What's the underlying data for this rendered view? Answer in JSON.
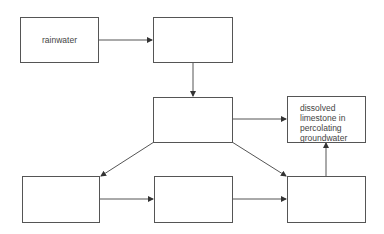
{
  "diagram": {
    "title": "",
    "nodes": [
      {
        "id": "rainwater",
        "label": "rainwater"
      },
      {
        "id": "box2",
        "label": ""
      },
      {
        "id": "box3",
        "label": ""
      },
      {
        "id": "dissolved",
        "label": "dissolved limestone in percolating groundwater",
        "lines": [
          "dissolved",
          "limestone in",
          "percolating",
          "groundwater"
        ]
      },
      {
        "id": "bottom_left",
        "label": ""
      },
      {
        "id": "bottom_mid",
        "label": ""
      },
      {
        "id": "bottom_right",
        "label": ""
      }
    ],
    "edges": [
      {
        "from": "rainwater",
        "to": "box2"
      },
      {
        "from": "box2",
        "to": "box3"
      },
      {
        "from": "box3",
        "to": "dissolved"
      },
      {
        "from": "box3",
        "to": "bottom_left"
      },
      {
        "from": "box3",
        "to": "bottom_right"
      },
      {
        "from": "bottom_left",
        "to": "bottom_mid"
      },
      {
        "from": "bottom_mid",
        "to": "bottom_right"
      },
      {
        "from": "bottom_right",
        "to": "dissolved"
      }
    ],
    "colors": {
      "line": "#555555",
      "text": "#444444",
      "background": "#ffffff"
    }
  }
}
